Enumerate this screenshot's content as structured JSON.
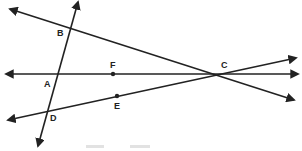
{
  "diagram": {
    "type": "geometry-lines",
    "colors": {
      "line": "#222222",
      "background": "#ffffff"
    },
    "points": {
      "A": {
        "label": "A",
        "x": 56,
        "y": 74
      },
      "B": {
        "label": "B",
        "x": 69,
        "y": 28
      },
      "C": {
        "label": "C",
        "x": 224,
        "y": 74
      },
      "D": {
        "label": "D",
        "x": 48,
        "y": 107
      },
      "E": {
        "label": "E",
        "x": 117,
        "y": 96
      },
      "F": {
        "label": "F",
        "x": 113,
        "y": 74
      }
    },
    "lines": [
      {
        "name": "line-BC",
        "through": [
          "B",
          "C"
        ]
      },
      {
        "name": "line-AFC",
        "through": [
          "A",
          "F",
          "C"
        ]
      },
      {
        "name": "line-DEC",
        "through": [
          "D",
          "E",
          "C"
        ]
      },
      {
        "name": "transversal-BAD",
        "through": [
          "B",
          "A",
          "D"
        ]
      }
    ],
    "labels": {
      "A": "A",
      "B": "B",
      "C": "C",
      "D": "D",
      "E": "E",
      "F": "F"
    }
  }
}
